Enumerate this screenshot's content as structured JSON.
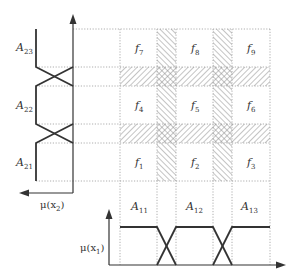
{
  "diagram": {
    "type": "fuzzy-partition-grid",
    "rule_cells": [
      {
        "label": "f",
        "sub": "7"
      },
      {
        "label": "f",
        "sub": "8"
      },
      {
        "label": "f",
        "sub": "9"
      },
      {
        "label": "f",
        "sub": "4"
      },
      {
        "label": "f",
        "sub": "5"
      },
      {
        "label": "f",
        "sub": "6"
      },
      {
        "label": "f",
        "sub": "1"
      },
      {
        "label": "f",
        "sub": "2"
      },
      {
        "label": "f",
        "sub": "3"
      }
    ],
    "x2_sets": [
      {
        "label": "A",
        "sub": "23"
      },
      {
        "label": "A",
        "sub": "22"
      },
      {
        "label": "A",
        "sub": "21"
      }
    ],
    "x1_sets": [
      {
        "label": "A",
        "sub": "11"
      },
      {
        "label": "A",
        "sub": "12"
      },
      {
        "label": "A",
        "sub": "13"
      }
    ],
    "axis_x2": {
      "label": "μ(x",
      "sub": "2",
      "close": ")"
    },
    "axis_x1": {
      "label": "μ(x",
      "sub": "1",
      "close": ")"
    },
    "colors": {
      "line": "#333333",
      "grid": "#9a9a9a",
      "hatch": "#8a8a8a"
    }
  }
}
